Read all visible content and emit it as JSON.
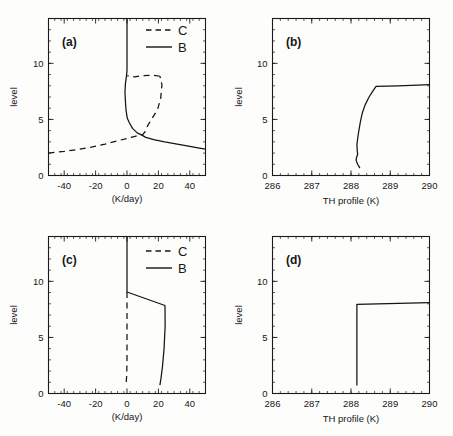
{
  "figure": {
    "title": "",
    "background": "#fdfdfc",
    "ink": "#141414"
  },
  "panels": {
    "a": {
      "tag": "(a)",
      "xlabel": "(K/day)",
      "ylabel": "level",
      "xticks": [
        "-40",
        "-20",
        "0",
        "20",
        "40"
      ],
      "yticks": [
        "0",
        "5",
        "10"
      ],
      "legend": [
        {
          "label": "C",
          "style": "dashed"
        },
        {
          "label": "B",
          "style": "solid"
        }
      ]
    },
    "b": {
      "tag": "(b)",
      "xlabel": "TH profile (K)",
      "ylabel": "level",
      "xticks": [
        "286",
        "287",
        "288",
        "289",
        "290"
      ],
      "yticks": [
        "0",
        "5",
        "10"
      ],
      "legend": []
    },
    "c": {
      "tag": "(c)",
      "xlabel": "(K/day)",
      "ylabel": "level",
      "xticks": [
        "-40",
        "-20",
        "0",
        "20",
        "40"
      ],
      "yticks": [
        "0",
        "5",
        "10"
      ],
      "legend": [
        {
          "label": "C",
          "style": "dashed"
        },
        {
          "label": "B",
          "style": "solid"
        }
      ]
    },
    "d": {
      "tag": "(d)",
      "xlabel": "TH profile (K)",
      "ylabel": "level",
      "xticks": [
        "286",
        "287",
        "288",
        "289",
        "290"
      ],
      "yticks": [
        "0",
        "5",
        "10"
      ],
      "legend": []
    }
  },
  "chart_data": [
    {
      "id": "a",
      "type": "line",
      "title": "(a)",
      "xlabel": "(K/day)",
      "ylabel": "level",
      "xlim": [
        -50,
        50
      ],
      "ylim": [
        0,
        14
      ],
      "xticks": [
        -40,
        -20,
        0,
        20,
        40
      ],
      "yticks": [
        0,
        5,
        10
      ],
      "grid": false,
      "legend": [
        "C",
        "B"
      ],
      "legend_position": "top-right",
      "series": [
        {
          "name": "B",
          "style": "solid",
          "x": [
            0.0,
            0.0,
            -0.3,
            -1.0,
            -1.3,
            -1.0,
            -0.6,
            0.2,
            1.5,
            3.5,
            6.5,
            9.5,
            12.0,
            17.0,
            24.0,
            32.0,
            40.0,
            46.0,
            50.0
          ],
          "y": [
            14.0,
            9.4,
            8.9,
            8.2,
            7.4,
            6.6,
            5.8,
            5.1,
            4.7,
            4.2,
            3.8,
            3.6,
            3.4,
            3.2,
            3.0,
            2.8,
            2.6,
            2.45,
            2.35
          ]
        },
        {
          "name": "C",
          "style": "dashed",
          "x": [
            -50.0,
            -40.0,
            -30.0,
            -22.0,
            -14.0,
            -6.0,
            0.0,
            4.0,
            8.0,
            10.0,
            11.5,
            13.0,
            16.0,
            19.5,
            21.5,
            22.0,
            22.3,
            21.0
          ],
          "y": [
            2.0,
            2.15,
            2.35,
            2.55,
            2.8,
            3.1,
            3.3,
            3.45,
            3.6,
            3.65,
            3.9,
            4.4,
            5.1,
            5.9,
            6.9,
            7.8,
            8.05,
            8.85
          ]
        },
        {
          "name": "C-top",
          "style": "dashed",
          "x": [
            21.0,
            16.0,
            10.0,
            5.0,
            1.5,
            0.2
          ],
          "y": [
            8.85,
            8.95,
            8.9,
            8.8,
            8.85,
            8.9
          ]
        }
      ]
    },
    {
      "id": "b",
      "type": "line",
      "title": "(b)",
      "xlabel": "TH profile (K)",
      "ylabel": "level",
      "xlim": [
        286,
        290
      ],
      "ylim": [
        0,
        14
      ],
      "xticks": [
        286,
        287,
        288,
        289,
        290
      ],
      "yticks": [
        0,
        5,
        10
      ],
      "grid": false,
      "legend": [],
      "series": [
        {
          "name": "TH",
          "style": "solid",
          "x": [
            288.22,
            288.17,
            288.13,
            288.14,
            288.17,
            288.16,
            288.15,
            288.17,
            288.2,
            288.24,
            288.29,
            288.36,
            288.46,
            288.56,
            288.62,
            288.64,
            289.2,
            289.7,
            290.0
          ],
          "y": [
            0.7,
            1.0,
            1.35,
            1.6,
            1.9,
            2.2,
            2.7,
            3.3,
            4.0,
            4.8,
            5.6,
            6.3,
            7.0,
            7.55,
            7.85,
            7.95,
            8.0,
            8.05,
            8.1
          ]
        }
      ]
    },
    {
      "id": "c",
      "type": "line",
      "title": "(c)",
      "xlabel": "(K/day)",
      "ylabel": "level",
      "xlim": [
        -50,
        50
      ],
      "ylim": [
        0,
        14
      ],
      "xticks": [
        -40,
        -20,
        0,
        20,
        40
      ],
      "yticks": [
        0,
        5,
        10
      ],
      "grid": false,
      "legend": [
        "C",
        "B"
      ],
      "legend_position": "top-right",
      "series": [
        {
          "name": "B",
          "style": "solid",
          "x": [
            0.0,
            0.0,
            24.2,
            24.3,
            23.6,
            22.6,
            21.6,
            21.0
          ],
          "y": [
            14.0,
            9.05,
            7.85,
            6.0,
            4.0,
            2.4,
            1.3,
            0.8
          ]
        },
        {
          "name": "C",
          "style": "dashed",
          "x": [
            0.0,
            0.0,
            -0.2,
            -0.6
          ],
          "y": [
            9.05,
            3.0,
            1.6,
            0.8
          ]
        }
      ]
    },
    {
      "id": "d",
      "type": "line",
      "title": "(d)",
      "xlabel": "TH profile (K)",
      "ylabel": "level",
      "xlim": [
        286,
        290
      ],
      "ylim": [
        0,
        14
      ],
      "xticks": [
        286,
        287,
        288,
        289,
        290
      ],
      "yticks": [
        0,
        5,
        10
      ],
      "grid": false,
      "legend": [],
      "series": [
        {
          "name": "TH",
          "style": "solid",
          "x": [
            288.15,
            288.15,
            290.0
          ],
          "y": [
            0.75,
            7.95,
            8.1
          ]
        }
      ]
    }
  ]
}
